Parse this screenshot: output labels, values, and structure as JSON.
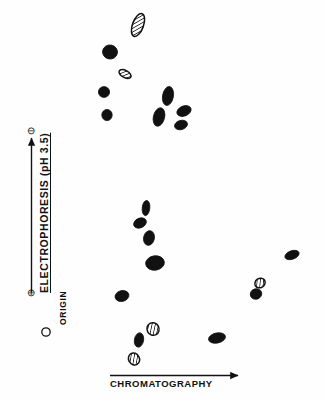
{
  "figure": {
    "kind": "two-dimensional-peptide-map",
    "background_color": "#fefefe",
    "ink_color": "#111111"
  },
  "axes": {
    "vertical": {
      "label": "ELECTROPHORESIS (pH 3.5)",
      "top_polarity_symbol": "⊖",
      "top_polarity_name": "minus-circle-icon",
      "bottom_polarity_symbol": "⊕",
      "bottom_polarity_name": "plus-circle-icon",
      "arrow_direction": "up"
    },
    "horizontal": {
      "label": "CHROMATOGRAPHY",
      "arrow_direction": "right"
    }
  },
  "origin": {
    "label": "ORIGIN",
    "marker": "open-circle",
    "x": 46,
    "y": 332,
    "r": 4.2
  },
  "chart_data": {
    "type": "scatter",
    "title": "",
    "xlabel": "CHROMATOGRAPHY",
    "ylabel": "ELECTROPHORESIS (pH 3.5)",
    "xlim": [
      0,
      325
    ],
    "ylim": [
      400,
      0
    ],
    "grid": false,
    "legend": "none",
    "fill_types": [
      "solid",
      "hatched"
    ],
    "spots": [
      {
        "id": 1,
        "x": 138,
        "y": 25,
        "rx": 5.5,
        "ry": 12.0,
        "rot": 20,
        "fill": "hatched"
      },
      {
        "id": 2,
        "x": 110,
        "y": 52,
        "rx": 7.5,
        "ry": 7.0,
        "rot": 10,
        "fill": "solid"
      },
      {
        "id": 3,
        "x": 125,
        "y": 74,
        "rx": 6.5,
        "ry": 3.6,
        "rot": 28,
        "fill": "hatched"
      },
      {
        "id": 4,
        "x": 104,
        "y": 92,
        "rx": 5.6,
        "ry": 5.4,
        "rot": 0,
        "fill": "solid"
      },
      {
        "id": 5,
        "x": 107,
        "y": 115,
        "rx": 5.2,
        "ry": 5.6,
        "rot": 0,
        "fill": "solid"
      },
      {
        "id": 6,
        "x": 168,
        "y": 96,
        "rx": 5.4,
        "ry": 9.6,
        "rot": 10,
        "fill": "solid"
      },
      {
        "id": 7,
        "x": 184,
        "y": 111,
        "rx": 7.4,
        "ry": 5.0,
        "rot": -22,
        "fill": "solid"
      },
      {
        "id": 8,
        "x": 159,
        "y": 117,
        "rx": 5.6,
        "ry": 9.4,
        "rot": 14,
        "fill": "solid"
      },
      {
        "id": 9,
        "x": 181,
        "y": 125,
        "rx": 6.6,
        "ry": 4.6,
        "rot": -16,
        "fill": "solid"
      },
      {
        "id": 10,
        "x": 146,
        "y": 208,
        "rx": 3.8,
        "ry": 7.6,
        "rot": 6,
        "fill": "solid"
      },
      {
        "id": 11,
        "x": 140,
        "y": 223,
        "rx": 6.6,
        "ry": 4.8,
        "rot": -24,
        "fill": "solid"
      },
      {
        "id": 12,
        "x": 149,
        "y": 238,
        "rx": 5.4,
        "ry": 7.4,
        "rot": 12,
        "fill": "solid"
      },
      {
        "id": 13,
        "x": 155,
        "y": 263,
        "rx": 9.4,
        "ry": 7.2,
        "rot": -8,
        "fill": "solid"
      },
      {
        "id": 14,
        "x": 122,
        "y": 296,
        "rx": 7.0,
        "ry": 5.4,
        "rot": -14,
        "fill": "solid"
      },
      {
        "id": 15,
        "x": 153,
        "y": 329,
        "rx": 6.0,
        "ry": 6.4,
        "rot": -28,
        "fill": "hatched"
      },
      {
        "id": 16,
        "x": 139,
        "y": 340,
        "rx": 4.6,
        "ry": 7.2,
        "rot": 10,
        "fill": "solid"
      },
      {
        "id": 17,
        "x": 134,
        "y": 359,
        "rx": 5.4,
        "ry": 6.2,
        "rot": -30,
        "fill": "hatched"
      },
      {
        "id": 18,
        "x": 217,
        "y": 338,
        "rx": 8.6,
        "ry": 5.0,
        "rot": -12,
        "fill": "solid"
      },
      {
        "id": 19,
        "x": 292,
        "y": 255,
        "rx": 7.4,
        "ry": 4.2,
        "rot": -20,
        "fill": "solid"
      },
      {
        "id": 20,
        "x": 260,
        "y": 283,
        "rx": 5.4,
        "ry": 4.6,
        "rot": -34,
        "fill": "hatched"
      },
      {
        "id": 21,
        "x": 256,
        "y": 294,
        "rx": 5.8,
        "ry": 5.2,
        "rot": -20,
        "fill": "solid"
      }
    ]
  }
}
